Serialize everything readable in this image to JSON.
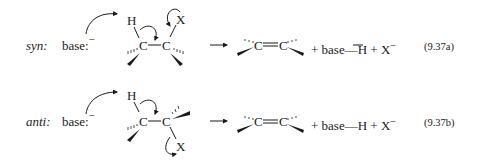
{
  "diagram": {
    "reactions": [
      {
        "id": "syn",
        "label": "syn:",
        "base": "base:",
        "base_charge": "−",
        "reactant_atoms": {
          "H": "H",
          "C1": "C",
          "C2": "C",
          "X": "X"
        },
        "dash": "—",
        "product_left": "C",
        "product_double_bond": "=",
        "product_right": "C",
        "byproducts": "+ base—H + X",
        "byproduct_charge": "−",
        "equation_number": "(9.37a)"
      },
      {
        "id": "anti",
        "label": "anti:",
        "base": "base:",
        "base_charge": "−",
        "reactant_atoms": {
          "H": "H",
          "C1": "C",
          "C2": "C",
          "X": "X"
        },
        "dash": "—",
        "product_left": "C",
        "product_double_bond": "=",
        "product_right": "C",
        "byproducts": "+ base—H + X",
        "byproduct_charge": "−",
        "equation_number": "(9.37b)"
      }
    ],
    "reaction_arrow": "→"
  }
}
